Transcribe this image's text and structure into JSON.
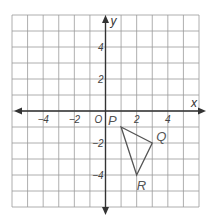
{
  "figure": {
    "type": "coordinate-plane",
    "x_axis_label": "x",
    "y_axis_label": "y",
    "origin_label": "O",
    "x_range": [
      -6,
      6
    ],
    "y_range": [
      -6,
      6
    ],
    "x_tick_labels": [
      {
        "value": -4,
        "label": "−4"
      },
      {
        "value": -2,
        "label": "−2"
      },
      {
        "value": 2,
        "label": "2"
      },
      {
        "value": 4,
        "label": "4"
      }
    ],
    "y_tick_labels": [
      {
        "value": 4,
        "label": "4"
      },
      {
        "value": 2,
        "label": "2"
      },
      {
        "value": -2,
        "label": "−2"
      },
      {
        "value": -4,
        "label": "−4"
      }
    ],
    "triangle": {
      "name": "PQR",
      "vertices": [
        {
          "label": "P",
          "x": 1,
          "y": -1
        },
        {
          "label": "Q",
          "x": 3,
          "y": -2
        },
        {
          "label": "R",
          "x": 2,
          "y": -4
        }
      ]
    },
    "colors": {
      "grid": "#9a9a9a",
      "axis": "#333333",
      "triangle": "#555555"
    }
  }
}
